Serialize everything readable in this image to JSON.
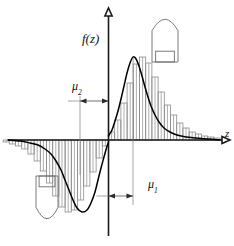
{
  "figure": {
    "axes": {
      "y_axis_label": "f(z)",
      "x_axis_label": "z",
      "x_axis_y": 140,
      "y_axis_x": 108.5,
      "x_axis_start": 8,
      "x_axis_end": 222,
      "y_axis_top": 16,
      "y_axis_bottom": 236
    },
    "annotations": [
      {
        "name": "mu2",
        "label": "μ",
        "subscript": "2",
        "label_x": 72,
        "label_y": 90,
        "dim_y": 101,
        "dim_from": 80,
        "dim_to": 108.5,
        "leader_x": 80,
        "leader_from_y": 96,
        "leader_to_y": 175
      },
      {
        "name": "mu1",
        "label": "μ",
        "subscript": "1",
        "label_x": 148,
        "label_y": 188,
        "dim_y": 196,
        "dim_from": 108.5,
        "dim_to": 133,
        "leader_x": 133,
        "leader_from_y": 58,
        "leader_to_y": 205
      }
    ],
    "ships": [
      {
        "name": "ship-upper-right",
        "orientation": "bow-up",
        "x": 152,
        "y": 8,
        "width": 26,
        "height": 54
      },
      {
        "name": "ship-lower-left",
        "orientation": "bow-down",
        "x": 36,
        "y": 176,
        "width": 22,
        "height": 54
      }
    ],
    "colors": {
      "axis": "#1a1a1a",
      "curve": "#000000",
      "histogram": "#8c8c8c",
      "ship_outline": "#6b6b6b",
      "dimension": "#4d4d4d",
      "background": "#ffffff"
    }
  },
  "chart_data": {
    "type": "line",
    "title": "f(z)",
    "xlabel": "z",
    "ylabel": "f(z)",
    "grid": false,
    "legend": false,
    "xlim": [
      8,
      222
    ],
    "ylim": [
      -75,
      85
    ],
    "axis_origin_px": {
      "x": 108.5,
      "y": 140
    },
    "series": [
      {
        "name": "positive-lobe-curve",
        "comment": "Smooth density curve for the positive (right) lobe; px coordinates, y up from axis.",
        "points_px": [
          [
            108.5,
            4
          ],
          [
            112,
            10
          ],
          [
            115,
            19
          ],
          [
            118,
            29
          ],
          [
            121,
            41
          ],
          [
            124,
            54
          ],
          [
            127,
            67
          ],
          [
            130,
            77
          ],
          [
            133,
            83
          ],
          [
            136,
            81
          ],
          [
            139,
            74
          ],
          [
            142,
            64
          ],
          [
            145,
            53
          ],
          [
            148,
            43
          ],
          [
            151,
            34
          ],
          [
            155,
            25
          ],
          [
            159,
            18
          ],
          [
            164,
            12
          ],
          [
            170,
            8
          ],
          [
            177,
            5
          ],
          [
            186,
            3
          ],
          [
            196,
            2
          ],
          [
            208,
            1
          ],
          [
            220,
            0
          ]
        ]
      },
      {
        "name": "negative-lobe-curve",
        "comment": "Smooth density curve for the negative (left) lobe; px coordinates, y down from axis.",
        "points_px": [
          [
            8,
            0
          ],
          [
            20,
            1
          ],
          [
            30,
            3
          ],
          [
            38,
            5
          ],
          [
            45,
            9
          ],
          [
            51,
            14
          ],
          [
            56,
            21
          ],
          [
            61,
            30
          ],
          [
            65,
            40
          ],
          [
            69,
            50
          ],
          [
            73,
            60
          ],
          [
            77,
            68
          ],
          [
            82,
            72
          ],
          [
            87,
            70
          ],
          [
            91,
            63
          ],
          [
            95,
            52
          ],
          [
            98,
            40
          ],
          [
            101,
            28
          ],
          [
            104,
            17
          ],
          [
            106.5,
            8
          ],
          [
            108.5,
            2
          ]
        ]
      },
      {
        "name": "positive-lobe-histogram",
        "comment": "Bar heights in px above the z-axis; bar width 6.2px starting at the y-axis.",
        "bar_width_px": 6.2,
        "start_x_px": 108.5,
        "values_px": [
          8,
          20,
          37,
          57,
          76,
          83,
          77,
          63,
          48,
          35,
          25,
          17,
          12,
          8,
          6,
          4,
          3,
          2
        ]
      },
      {
        "name": "negative-lobe-histogram",
        "comment": "Bar depths in px below the z-axis; bar width 6.2px extending left from the y-axis.",
        "bar_width_px": 6.2,
        "start_x_px": 108.5,
        "values_px": [
          6,
          18,
          32,
          46,
          60,
          70,
          72,
          67,
          56,
          43,
          31,
          21,
          14,
          9,
          6,
          4,
          2
        ]
      }
    ]
  }
}
